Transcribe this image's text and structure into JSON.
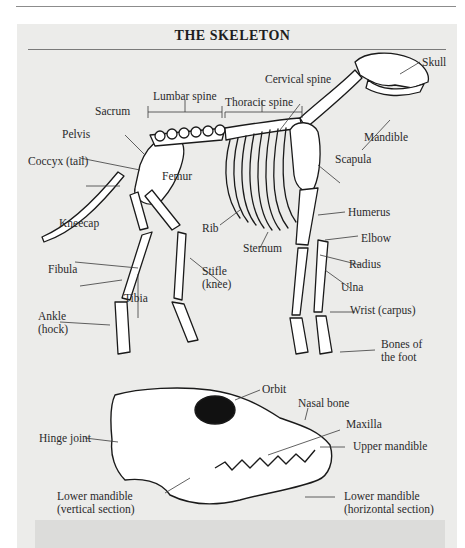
{
  "title": "THE SKELETON",
  "colors": {
    "panel_bg": "#ececea",
    "rule": "#7a7a7a",
    "text": "#2a2a2a",
    "bone_fill": "#ffffff",
    "outline": "#1a1a1a",
    "footer_band": "#dcdcda"
  },
  "skeleton_labels": {
    "skull": "Skull",
    "cervical_spine": "Cervical spine",
    "lumbar_spine": "Lumbar spine",
    "thoracic_spine": "Thoracic spine",
    "sacrum": "Sacrum",
    "pelvis": "Pelvis",
    "coccyx": "Coccyx (tail)",
    "mandible": "Mandible",
    "scapula": "Scapula",
    "femur": "Femur",
    "kneecap": "Kneecap",
    "rib": "Rib",
    "humerus": "Humerus",
    "elbow": "Elbow",
    "sternum": "Sternum",
    "fibula": "Fibula",
    "stifle_line1": "Stifle",
    "stifle_line2": "(knee)",
    "radius": "Radius",
    "tibia": "Tibia",
    "ulna": "Ulna",
    "ankle_line1": "Ankle",
    "ankle_line2": "(hock)",
    "wrist": "Wrist (carpus)",
    "foot_line1": "Bones of",
    "foot_line2": "the foot"
  },
  "skull_labels": {
    "orbit": "Orbit",
    "nasal_bone": "Nasal bone",
    "maxilla": "Maxilla",
    "hinge_joint": "Hinge joint",
    "upper_mandible": "Upper mandible",
    "lower_mandible_vertical_line1": "Lower mandible",
    "lower_mandible_vertical_line2": "(vertical section)",
    "lower_mandible_horizontal_line1": "Lower mandible",
    "lower_mandible_horizontal_line2": "(horizontal section)"
  }
}
